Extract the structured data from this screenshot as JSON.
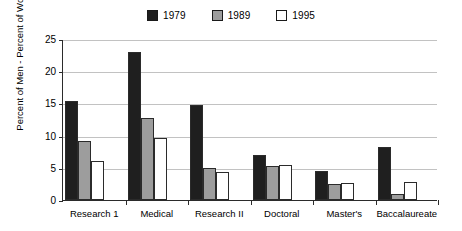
{
  "chart_data": {
    "type": "bar",
    "title": "",
    "subtitle": "",
    "xlabel": "",
    "ylabel": "Percent of Men - Percent of Women",
    "categories": [
      "Research 1",
      "Medical",
      "Research II",
      "Doctoral",
      "Master's",
      "Baccalaureate"
    ],
    "series": [
      {
        "name": "1979",
        "color": "#1f1f1f",
        "values": [
          15.3,
          23.0,
          14.8,
          7.0,
          4.5,
          8.2
        ]
      },
      {
        "name": "1989",
        "color": "#9d9d9d",
        "values": [
          9.2,
          12.8,
          5.0,
          5.3,
          2.5,
          0.9
        ]
      },
      {
        "name": "1995",
        "color": "#ffffff",
        "values": [
          6.0,
          9.6,
          4.4,
          5.5,
          2.7,
          2.8
        ]
      }
    ],
    "ylim": [
      0,
      25
    ],
    "yticks": [
      0,
      5,
      10,
      15,
      20,
      25
    ],
    "ytick_labels": [
      "0",
      "5",
      "10",
      "15",
      "20",
      "25"
    ],
    "grid": true,
    "legend_position": "top-center"
  },
  "legend": {
    "items": [
      {
        "label": "1979",
        "swatch_color": "#1f1f1f"
      },
      {
        "label": "1989",
        "swatch_color": "#9d9d9d"
      },
      {
        "label": "1995",
        "swatch_color": "#ffffff"
      }
    ]
  }
}
